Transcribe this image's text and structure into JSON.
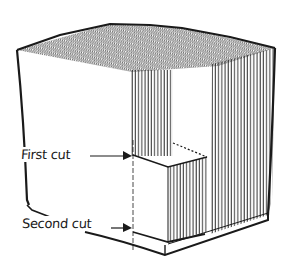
{
  "figure": {
    "labels": {
      "first_cut": "First cut",
      "second_cut": "Second cut"
    },
    "colors": {
      "ink": "#1a1a1a",
      "background": "#ffffff"
    }
  }
}
